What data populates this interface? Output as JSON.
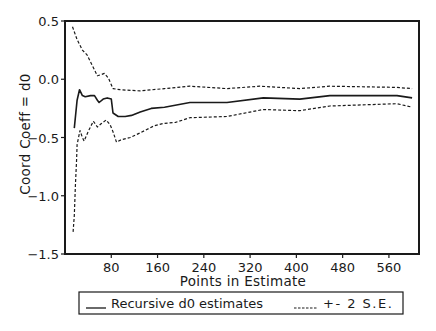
{
  "chart_data": {
    "type": "line",
    "title": "",
    "xlabel": "Points in Estimate",
    "ylabel": "Coord Coeff = d0",
    "xlim": [
      0,
      612
    ],
    "ylim": [
      -1.5,
      0.5
    ],
    "grid": false,
    "x_ticks": [
      80,
      160,
      240,
      320,
      400,
      480,
      560
    ],
    "x_tick_labels": [
      "80",
      "160",
      "240",
      "320",
      "400",
      "480",
      "560"
    ],
    "y_ticks": [
      0.5,
      0.0,
      -0.5,
      -1.0,
      -1.5
    ],
    "y_tick_labels": [
      "0.5",
      "0.0",
      "-0.5",
      "-1.0",
      "-1.5"
    ],
    "legend_position": "bottom",
    "legend": [
      {
        "label": "Recursive d0 estimates",
        "style": "solid"
      },
      {
        "label": "+- 2 S.E.",
        "style": "dashed"
      }
    ],
    "series": [
      {
        "name": "Recursive d0 estimates",
        "style": "solid",
        "x": [
          16,
          21,
          25,
          30,
          35,
          44,
          51,
          56,
          59,
          66,
          73,
          80,
          83,
          92,
          104,
          115,
          130,
          149,
          172,
          216,
          280,
          343,
          406,
          458,
          510,
          574,
          600
        ],
        "values": [
          -0.42,
          -0.18,
          -0.09,
          -0.14,
          -0.15,
          -0.14,
          -0.14,
          -0.18,
          -0.2,
          -0.17,
          -0.16,
          -0.17,
          -0.29,
          -0.32,
          -0.32,
          -0.31,
          -0.28,
          -0.25,
          -0.24,
          -0.2,
          -0.2,
          -0.16,
          -0.17,
          -0.14,
          -0.14,
          -0.14,
          -0.16
        ]
      },
      {
        "name": "+2 S.E.",
        "style": "dashed",
        "x": [
          13,
          21,
          30,
          38,
          47,
          56,
          63,
          68,
          75,
          83,
          95,
          130,
          172,
          216,
          280,
          337,
          406,
          458,
          574,
          600
        ],
        "values": [
          0.45,
          0.34,
          0.25,
          0.21,
          0.12,
          0.03,
          0.04,
          0.05,
          0.01,
          -0.08,
          -0.09,
          -0.1,
          -0.08,
          -0.06,
          -0.08,
          -0.06,
          -0.08,
          -0.06,
          -0.07,
          -0.08
        ]
      },
      {
        "name": "-2 S.E.",
        "style": "dashed",
        "x": [
          14,
          16,
          18,
          20,
          21,
          26,
          30,
          33,
          40,
          49,
          56,
          63,
          71,
          78,
          83,
          89,
          97,
          113,
          130,
          154,
          170,
          191,
          216,
          280,
          343,
          406,
          458,
          574,
          600
        ],
        "values": [
          -1.31,
          -1.17,
          -0.91,
          -0.69,
          -0.56,
          -0.44,
          -0.5,
          -0.53,
          -0.45,
          -0.36,
          -0.41,
          -0.38,
          -0.35,
          -0.39,
          -0.45,
          -0.54,
          -0.52,
          -0.5,
          -0.46,
          -0.4,
          -0.38,
          -0.37,
          -0.33,
          -0.32,
          -0.26,
          -0.27,
          -0.23,
          -0.21,
          -0.24
        ]
      }
    ]
  },
  "colors": {
    "line": "#1a1a1a",
    "frame": "#1a1a1a",
    "background": "#ffffff"
  }
}
